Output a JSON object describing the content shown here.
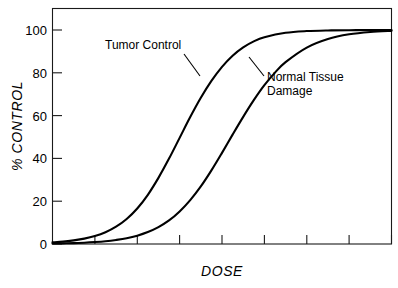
{
  "chart_data": {
    "type": "line",
    "title": "",
    "subtitle": "",
    "xlabel": "DOSE",
    "ylabel": "% CONTROL",
    "xlim": [
      0,
      8
    ],
    "ylim": [
      0,
      110
    ],
    "grid": false,
    "legend_position": "inline-annotations",
    "y_ticks": [
      0,
      20,
      40,
      60,
      80,
      100
    ],
    "y_tick_labels": [
      "0",
      "20",
      "40",
      "60",
      "80",
      "100"
    ],
    "x_ticks": [
      1,
      2,
      3,
      4,
      5,
      6,
      7,
      8
    ],
    "x_tick_labels": [
      "",
      "",
      "",
      "",
      "",
      "",
      "",
      ""
    ],
    "annotations": [
      {
        "id": "tumor-control",
        "text_lines": [
          "Tumor Control"
        ],
        "label_x": 0.255,
        "label_y": 0.155
      },
      {
        "id": "normal-tissue-damage",
        "text_lines": [
          "Normal Tissue",
          "Damage"
        ],
        "label_x": 0.55,
        "label_y": 0.285
      }
    ],
    "series": [
      {
        "name": "Tumor Control",
        "color": "#000000",
        "midpoint_dose": 2.96,
        "steepness": 1.62,
        "x": [
          0.0,
          0.25,
          0.5,
          0.75,
          1.0,
          1.25,
          1.5,
          1.75,
          2.0,
          2.25,
          2.5,
          2.75,
          3.0,
          3.25,
          3.5,
          3.75,
          4.0,
          4.25,
          4.5,
          4.75,
          5.0,
          5.5,
          6.0,
          6.5,
          7.0,
          7.5,
          8.0
        ],
        "values": [
          0.8,
          1.1,
          1.7,
          2.5,
          3.7,
          5.5,
          8.1,
          11.7,
          16.6,
          23.0,
          30.9,
          39.9,
          49.6,
          59.3,
          68.3,
          76.2,
          82.8,
          88.0,
          91.9,
          94.7,
          96.6,
          98.7,
          99.5,
          99.8,
          99.9,
          100.0,
          100.0
        ]
      },
      {
        "name": "Normal Tissue Damage",
        "color": "#000000",
        "midpoint_dose": 4.13,
        "steepness": 1.48,
        "x": [
          0.0,
          0.25,
          0.5,
          0.75,
          1.0,
          1.25,
          1.5,
          1.75,
          2.0,
          2.25,
          2.5,
          2.75,
          3.0,
          3.25,
          3.5,
          3.75,
          4.0,
          4.25,
          4.5,
          4.75,
          5.0,
          5.25,
          5.5,
          6.0,
          6.5,
          7.0,
          7.5,
          8.0
        ],
        "values": [
          0.2,
          0.3,
          0.4,
          0.6,
          0.9,
          1.3,
          1.9,
          2.7,
          3.9,
          5.6,
          7.9,
          11.0,
          15.2,
          20.5,
          26.9,
          34.4,
          42.6,
          51.1,
          59.4,
          67.2,
          74.2,
          80.1,
          85.0,
          91.8,
          95.8,
          98.0,
          99.1,
          99.6
        ]
      }
    ]
  },
  "figure": {
    "background_color": "#ffffff",
    "axis_color": "#1a1a1a",
    "curve_color": "#000000"
  }
}
